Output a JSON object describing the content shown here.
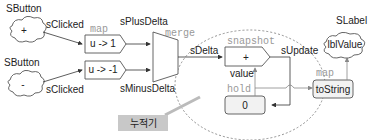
{
  "inputs": [
    {
      "widget": "SButton",
      "glyph": "+",
      "stream": "sClicked"
    },
    {
      "widget": "SButton",
      "glyph": "-",
      "stream": "sClicked"
    }
  ],
  "maps": [
    {
      "op_label": "map",
      "fn": "u -> 1",
      "output": "sPlusDelta"
    },
    {
      "fn": "u -> -1",
      "output": "sMinusDelta"
    }
  ],
  "merge": {
    "op_label": "merge",
    "output": "sDelta"
  },
  "snapshot": {
    "op_label": "snapshot",
    "fn": "+",
    "input_label": "value",
    "output": "sUpdate"
  },
  "hold": {
    "op_label": "hold",
    "initial": "0"
  },
  "to_string": {
    "op_label": "map",
    "fn": "toString"
  },
  "output": {
    "widget": "SLabel",
    "cell": "lblValue"
  },
  "callout": {
    "text": "누적기"
  }
}
